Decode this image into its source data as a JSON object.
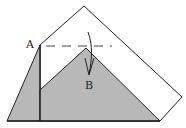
{
  "diagram": {
    "type": "origami-fold-step",
    "labels": {
      "point_a": "A",
      "point_b": "B"
    },
    "colors": {
      "paper_front": "#ffffff",
      "paper_back": "#b8b8b8",
      "line": "#222222"
    },
    "annotations": {
      "fold_line": "dashed valley fold",
      "arrow": "fold point down to B"
    }
  }
}
